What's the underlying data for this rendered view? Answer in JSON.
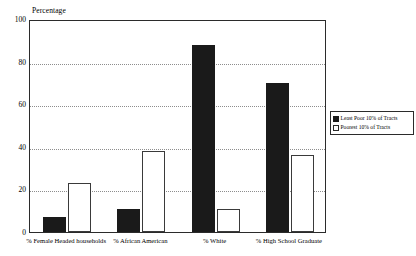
{
  "chart_data": {
    "type": "bar",
    "title": "",
    "ylabel": "Percentage",
    "xlabel": "",
    "ylim": [
      0,
      100
    ],
    "yticks": [
      0,
      20,
      40,
      60,
      80,
      100
    ],
    "grid": true,
    "legend_position": "right",
    "categories": [
      "% Female Headed households",
      "% African American",
      "% White",
      "% High School Graduate"
    ],
    "series": [
      {
        "name": "Least Poor 10% of Tracts",
        "color": "#1a1a1a",
        "values": [
          7,
          11,
          88,
          70
        ]
      },
      {
        "name": "Poorest 10% of Tracts",
        "color": "#ffffff",
        "values": [
          23,
          38,
          11,
          36
        ]
      }
    ]
  },
  "axis": {
    "y_title": "Percentage",
    "y_tick_labels": [
      "0",
      "20",
      "40",
      "60",
      "80",
      "100"
    ],
    "x_tick_labels": [
      "% Female Headed households",
      "% African American",
      "% White",
      "% High School Graduate"
    ]
  },
  "legend": {
    "items": [
      {
        "label": "Least Poor 10% of Tracts",
        "swatch": "filled-black-square"
      },
      {
        "label": "Poorest 10% of Tracts",
        "swatch": "outlined-white-square"
      }
    ]
  },
  "colors": {
    "series_dark": "#1a1a1a",
    "series_light": "#ffffff",
    "axis": "#2b2b2b",
    "gridline": "#8d8d8d",
    "background": "#ffffff"
  }
}
